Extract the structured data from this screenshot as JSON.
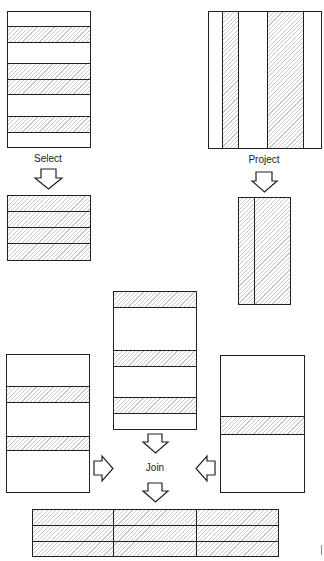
{
  "labels": {
    "select": "Select",
    "project": "Project",
    "join": "Join"
  },
  "colors": {
    "line": "#222222",
    "hatch": "#c9c9c9",
    "background": "#ffffff"
  },
  "select_source": {
    "rows": [
      "plain",
      "hatched",
      "plain",
      "hatched",
      "hatched",
      "plain",
      "hatched",
      "plain"
    ]
  },
  "select_result": {
    "rows": [
      "hatched",
      "hatched",
      "hatched",
      "hatched"
    ]
  },
  "project_source": {
    "columns": [
      "plain",
      "hatched",
      "plain",
      "hatched",
      "plain"
    ]
  },
  "project_result": {
    "columns": [
      "hatched",
      "hatched"
    ]
  },
  "join_left": {
    "rows": [
      "plain",
      "hatched",
      "plain",
      "hatched",
      "plain"
    ]
  },
  "join_middle": {
    "rows": [
      "hatched",
      "plain",
      "hatched",
      "plain",
      "hatched",
      "plain"
    ]
  },
  "join_right": {
    "rows": [
      "plain",
      "hatched",
      "plain"
    ]
  },
  "join_result": {
    "rows": 3,
    "columns": 3,
    "fill": "hatched"
  }
}
